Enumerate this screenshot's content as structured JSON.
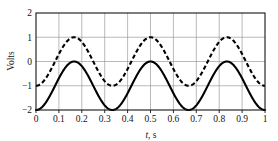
{
  "chart_data": {
    "type": "line",
    "title": "",
    "xlabel": "t, s",
    "ylabel": "Volts",
    "xlim": [
      0,
      1
    ],
    "ylim": [
      -2,
      2
    ],
    "grid": true,
    "legend": "none",
    "xticks": [
      "0",
      "0.1",
      "0.2",
      "0.3",
      "0.4",
      "0.5",
      "0.6",
      "0.7",
      "0.8",
      "0.9",
      "1"
    ],
    "xtick_values": [
      0,
      0.1,
      0.2,
      0.3,
      0.4,
      0.5,
      0.6,
      0.7,
      0.8,
      0.9,
      1
    ],
    "yticks": [
      "2",
      "1",
      "0",
      "−1",
      "−2"
    ],
    "ytick_values": [
      2,
      1,
      0,
      -1,
      -2
    ],
    "series": [
      {
        "name": "dashed-sinusoid",
        "style": "dashed",
        "color": "#000000",
        "amplitude": 1,
        "offset": 0,
        "frequency_hz": 3,
        "phase_deg": -90,
        "peak_value": 1,
        "trough_value": -1,
        "value_at_t0": -1,
        "peak_times": [
          0.0833,
          0.4167,
          0.75
        ],
        "trough_times": [
          0.25,
          0.5833,
          0.9167
        ]
      },
      {
        "name": "solid-sinusoid",
        "style": "solid",
        "color": "#000000",
        "amplitude": 1,
        "offset": -1,
        "frequency_hz": 3,
        "phase_deg": -90,
        "peak_value": 0,
        "trough_value": -2,
        "value_at_t0": -2,
        "peak_times": [
          0.0833,
          0.4167,
          0.75
        ],
        "trough_times": [
          0.25,
          0.5833,
          0.9167
        ]
      }
    ]
  }
}
